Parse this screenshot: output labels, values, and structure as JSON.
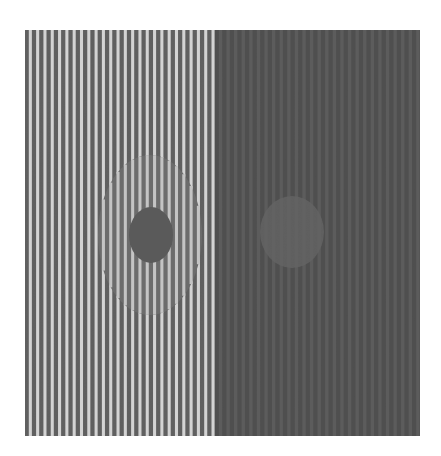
{
  "figure": {
    "colors": {
      "background": "#ffffff",
      "left_light_stripe": "#d9d9d9",
      "left_dark_stripe": "#5e5e5e",
      "right_stripe_a": "#4c4c4c",
      "right_stripe_b": "#5a5a5a",
      "left_large_disc": "#6b6b6b",
      "left_small_disc": "#585858",
      "right_disc": "#646464"
    },
    "left_half_stripe_count": 26,
    "right_half_stripe_count": 27
  }
}
